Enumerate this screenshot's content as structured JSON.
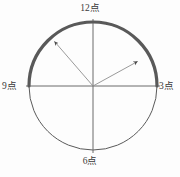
{
  "figure": {
    "kind": "clock-face-diagram",
    "labels": {
      "top": "12点",
      "right": "3点",
      "bottom": "6点",
      "left": "9点"
    },
    "colors": {
      "background": "#fdfdfd",
      "circle_stroke": "#5a5a5a",
      "axis_stroke": "#6b6b6b",
      "highlight_arc": "#595959",
      "arrow_stroke": "#8f8f8f",
      "arrow_head": "#4a4a4a",
      "label_text": "#3a3a3a"
    },
    "geometry": {
      "center_x": 93,
      "center_y": 86,
      "radius": 64,
      "circle_stroke_width": 1,
      "axis_stroke_width": 1,
      "highlight_arc_stroke_width": 3.2,
      "highlight_arc_start_deg": 180,
      "highlight_arc_end_deg": 0,
      "arrow_stroke_width": 0.9
    },
    "arrows": [
      {
        "name": "arrow-upper-left",
        "angle_deg": 129,
        "length": 60,
        "x2": 52.7,
        "y2": 39.4
      },
      {
        "name": "arrow-upper-right",
        "angle_deg": 29,
        "length": 54,
        "x2": 140.2,
        "y2": 59.8
      }
    ]
  }
}
